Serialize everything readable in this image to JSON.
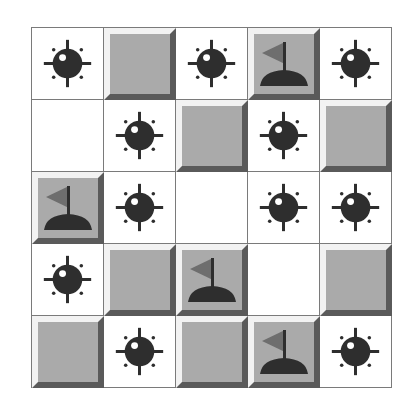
{
  "game": {
    "rows": 5,
    "cols": 5,
    "colors": {
      "grid_line": "#7a7a7a",
      "tile_face": "#aaaaaa",
      "tile_highlight": "#f2f2f2",
      "tile_shadow": "#5a5a5a",
      "mine": "#2e2e2e",
      "flag": "#6e6e6e",
      "flag_base": "#2e2e2e"
    },
    "board": [
      [
        "mine",
        "covered",
        "mine",
        "flag",
        "mine"
      ],
      [
        "empty",
        "mine",
        "covered",
        "mine",
        "covered"
      ],
      [
        "flag",
        "mine",
        "empty",
        "mine",
        "mine"
      ],
      [
        "mine",
        "covered",
        "flag",
        "empty",
        "covered"
      ],
      [
        "covered",
        "mine",
        "covered",
        "flag",
        "mine"
      ]
    ],
    "icons": {
      "mine": "mine-icon",
      "flag": "flag-icon"
    }
  }
}
